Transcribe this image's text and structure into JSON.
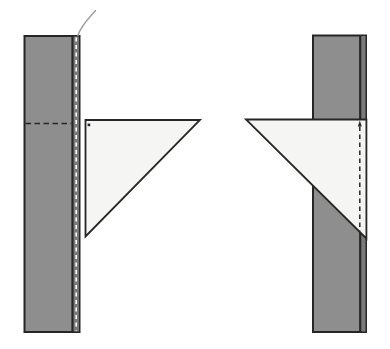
{
  "colors": {
    "background": "#ffffff",
    "strip_fill": "#8e8e8e",
    "seam_band_fill": "#7a7a7a",
    "outline": "#262626",
    "triangle_fill": "#f5f5f3",
    "stitch_white": "#ffffff",
    "dash_dark": "#262626",
    "thread": "#9c9c9c"
  },
  "figure": {
    "left_panel": {
      "strip": {
        "x": 24.5,
        "y": 36,
        "width": 55,
        "height": 296
      },
      "seam_line": {
        "x1": 72.5,
        "y1": 36,
        "x2": 72.5,
        "y2": 332
      },
      "seam_band": {
        "x": 73.6,
        "y": 36.5,
        "width": 5.2,
        "height": 295
      },
      "stitch_line": {
        "x1": 76.2,
        "y1": 37.5,
        "x2": 76.2,
        "y2": 330.5
      },
      "fold_dash_line": {
        "x1": 25.5,
        "y1": 123.5,
        "x2": 71.5,
        "y2": 123.5
      },
      "thread_path": "M 95.5,10.5 C 90,17 81.5,24.5 77.8,35.5",
      "triangle_points": "85.5,120 200,120 85.5,236.5",
      "pin_dot": {
        "x": 87.6,
        "y": 123.6,
        "width": 2.6,
        "height": 2.6
      }
    },
    "right_panel": {
      "strip": {
        "x": 313,
        "y": 35.5,
        "width": 53,
        "height": 296.5
      },
      "seam_line": {
        "x1": 360.2,
        "y1": 35.5,
        "x2": 360.2,
        "y2": 332
      },
      "seam_band": {
        "x": 361.3,
        "y": 36,
        "width": 4.2,
        "height": 295.5
      },
      "triangle_points": "246,119.5 366.4,119.5 366.4,238.5",
      "stitch_dash_line": {
        "x1": 359.8,
        "y1": 126.5,
        "x2": 359.8,
        "y2": 231
      },
      "arrow_points": "359.8,120.6 357.8,126.5 361.8,126.5"
    }
  }
}
